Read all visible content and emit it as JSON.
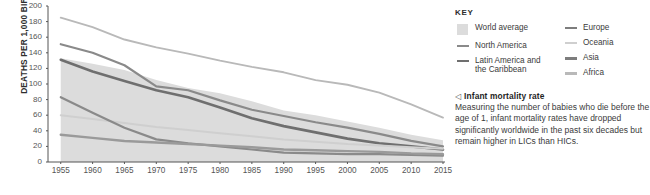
{
  "chart_data": {
    "type": "line",
    "title": "",
    "xlabel": "",
    "ylabel": "DEATHS PER 1,000 BIRTHS",
    "xlim": [
      1953,
      2015
    ],
    "ylim": [
      0,
      200
    ],
    "yticks": [
      0,
      20,
      40,
      60,
      80,
      100,
      120,
      140,
      160,
      180,
      200
    ],
    "x": [
      1955,
      1960,
      1965,
      1970,
      1975,
      1980,
      1985,
      1990,
      1995,
      2000,
      2005,
      2010,
      2015
    ],
    "grid": false,
    "legend_position": "right",
    "band": {
      "name": "World average",
      "color": "#dcdcdc",
      "upper": [
        133,
        126,
        118,
        105,
        95,
        88,
        78,
        66,
        60,
        52,
        44,
        35,
        28
      ],
      "lower": [
        0,
        0,
        0,
        0,
        0,
        0,
        0,
        0,
        0,
        0,
        0,
        0,
        0
      ]
    },
    "series": [
      {
        "name": "Africa",
        "color": "#b9b9b9",
        "width": 1.9,
        "values": [
          185,
          173,
          157,
          147,
          139,
          130,
          122,
          115,
          105,
          99,
          89,
          74,
          57
        ]
      },
      {
        "name": "Asia",
        "color": "#8a8a8a",
        "width": 2.2,
        "values": [
          151,
          140,
          124,
          97,
          92,
          79,
          67,
          59,
          51,
          44,
          36,
          27,
          20
        ]
      },
      {
        "name": "Latin America and the Caribbean",
        "color": "#6f6f6f",
        "width": 2.6,
        "values": [
          131,
          116,
          104,
          92,
          83,
          70,
          56,
          46,
          38,
          30,
          24,
          20,
          16
        ]
      },
      {
        "name": "Oceania",
        "color": "#cfcfcf",
        "width": 2.0,
        "values": [
          60,
          55,
          50,
          45,
          41,
          37,
          33,
          29,
          26,
          23,
          21,
          19,
          17
        ]
      },
      {
        "name": "North America",
        "color": "#8a8a8a",
        "width": 2.2,
        "values": [
          83,
          63,
          44,
          29,
          24,
          20,
          16,
          12,
          11,
          10,
          10,
          9,
          8
        ]
      },
      {
        "name": "Europe",
        "color": "#9a9a9a",
        "width": 2.4,
        "values": [
          35,
          31,
          27,
          25,
          23,
          21,
          19,
          16,
          15,
          14,
          13,
          11,
          10
        ]
      }
    ]
  },
  "legend": {
    "title": "KEY",
    "left_column": [
      {
        "label": "World average",
        "mark": "swatch",
        "color": "#dcdcdc"
      },
      {
        "label": "North America",
        "mark": "dash",
        "color": "#8a8a8a"
      },
      {
        "label": "Latin America and\nthe Caribbean",
        "mark": "dash",
        "color": "#6f6f6f"
      }
    ],
    "right_column": [
      {
        "label": "Europe",
        "mark": "dash",
        "color": "#7d7d7d"
      },
      {
        "label": "Oceania",
        "mark": "dash",
        "color": "#cfcfcf"
      },
      {
        "label": "Asia",
        "mark": "dash",
        "color": "#7d7d7d"
      },
      {
        "label": "Africa",
        "mark": "dash",
        "color": "#b9b9b9"
      }
    ]
  },
  "note": {
    "marker": "◁",
    "heading": "Infant mortality rate",
    "body": "Measuring the number of babies who die before the age of 1, infant mortality rates have dropped significantly worldwide in the past six decades but remain higher in LICs than HICs."
  }
}
